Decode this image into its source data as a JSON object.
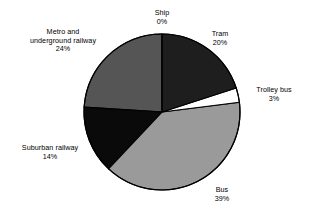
{
  "chart_data": {
    "type": "pie",
    "title": "",
    "subtitle": "",
    "xlabel": "",
    "ylabel": "",
    "legend_position": "none",
    "grid": false,
    "labels_show_percent": true,
    "start_angle_deg": 0,
    "direction": "clockwise",
    "categories": [
      "Ship",
      "Tram",
      "Trolley bus",
      "Bus",
      "Suburban railway",
      "Metro and underground railway"
    ],
    "values": [
      0,
      20,
      3,
      39,
      14,
      24
    ],
    "unit": "%",
    "slices": [
      {
        "name": "Ship",
        "label": "Ship",
        "value": 0,
        "value_text": "0%",
        "color": "#ffffff",
        "start_pct": 0,
        "end_pct": 0
      },
      {
        "name": "Tram",
        "label": "Tram",
        "value": 20,
        "value_text": "20%",
        "color": "#1e1e1e",
        "start_pct": 0,
        "end_pct": 20
      },
      {
        "name": "Trolley bus",
        "label": "Trolley bus",
        "value": 3,
        "value_text": "3%",
        "color": "#ffffff",
        "start_pct": 20,
        "end_pct": 23
      },
      {
        "name": "Bus",
        "label": "Bus",
        "value": 39,
        "value_text": "39%",
        "color": "#9a9a9a",
        "start_pct": 23,
        "end_pct": 62
      },
      {
        "name": "Suburban railway",
        "label": "Suburban railway",
        "value": 14,
        "value_text": "14%",
        "color": "#0a0a0a",
        "start_pct": 62,
        "end_pct": 76
      },
      {
        "name": "Metro and underground railway",
        "label_line1": "Metro and",
        "label_line2": "underground railway",
        "label": "Metro and underground railway",
        "value": 24,
        "value_text": "24%",
        "color": "#555555",
        "start_pct": 76,
        "end_pct": 100
      }
    ]
  },
  "figure": {
    "background": "#ffffff",
    "outline_color": "#000000",
    "center_x": 162,
    "center_y": 112,
    "radius": 78
  }
}
